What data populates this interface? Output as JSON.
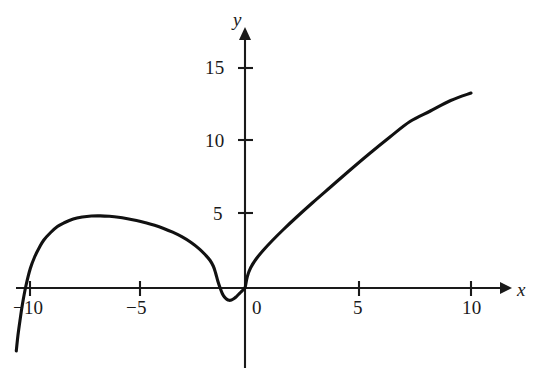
{
  "figure": {
    "kind": "cartesian-graph",
    "background_color": "#ffffff",
    "ink_color": "#1a1a1a"
  },
  "axes": {
    "x_axis_label": "x",
    "y_axis_label": "y",
    "x_tick_labels": [
      "−10",
      "−5",
      "0",
      "5",
      "10"
    ],
    "y_tick_labels": [
      "5",
      "10",
      "15"
    ],
    "x_tick_values": [
      -10,
      -5,
      0,
      5,
      10
    ],
    "y_tick_values": [
      5,
      10,
      15
    ],
    "x_arrow": "arrow-right",
    "y_arrow": "arrow-up"
  },
  "chart_data": {
    "type": "line",
    "title": "",
    "subtitle": "",
    "xlabel": "x",
    "ylabel": "y",
    "xlim": [
      -10.6,
      10.8
    ],
    "ylim": [
      -4.6,
      16.4
    ],
    "xticks": [
      -10,
      -5,
      0,
      5,
      10
    ],
    "yticks": [
      5,
      10,
      15
    ],
    "grid": false,
    "legend": null,
    "annotations": [],
    "series": [
      {
        "name": "curve",
        "color": "#111111",
        "note": "single continuous curve: arch over negative x peaking near x=-6.4 at y=4.8, steep descent through x=-10 down to y=-4.2, small U-shaped dip between x=-1.3 and x=0 reaching y=-0.8, then rising branch from origin to (10, 13)",
        "x": [
          -10.12,
          -10.05,
          -9.95,
          -9.85,
          -9.7,
          -9.5,
          -9.3,
          -9.1,
          -8.9,
          -8.6,
          -8.3,
          -8.0,
          -7.6,
          -7.2,
          -6.8,
          -6.4,
          -6.0,
          -5.6,
          -5.2,
          -4.8,
          -4.4,
          -4.0,
          -3.6,
          -3.2,
          -2.8,
          -2.4,
          -2.0,
          -1.75,
          -1.55,
          -1.4,
          -1.3,
          -1.2,
          -1.1,
          -1.0,
          -0.9,
          -0.8,
          -0.7,
          -0.6,
          -0.5,
          -0.4,
          -0.3,
          -0.2,
          -0.1,
          0.0,
          0.1,
          0.25,
          0.5,
          0.8,
          1.2,
          1.7,
          2.3,
          3.0,
          3.8,
          4.6,
          5.5,
          6.4,
          7.3,
          8.2,
          9.1,
          10.0
        ],
        "y": [
          -4.2,
          -3.2,
          -2.1,
          -1.1,
          0.1,
          1.3,
          2.1,
          2.7,
          3.2,
          3.7,
          4.1,
          4.35,
          4.6,
          4.73,
          4.8,
          4.81,
          4.78,
          4.72,
          4.62,
          4.5,
          4.35,
          4.18,
          3.97,
          3.72,
          3.42,
          3.05,
          2.58,
          2.2,
          1.85,
          1.45,
          1.0,
          0.45,
          0.0,
          -0.38,
          -0.62,
          -0.76,
          -0.82,
          -0.8,
          -0.72,
          -0.6,
          -0.45,
          -0.3,
          -0.15,
          0.0,
          0.75,
          1.35,
          1.95,
          2.5,
          3.15,
          3.9,
          4.75,
          5.7,
          6.75,
          7.8,
          8.95,
          10.05,
          11.1,
          11.8,
          12.5,
          13.0
        ]
      }
    ]
  }
}
